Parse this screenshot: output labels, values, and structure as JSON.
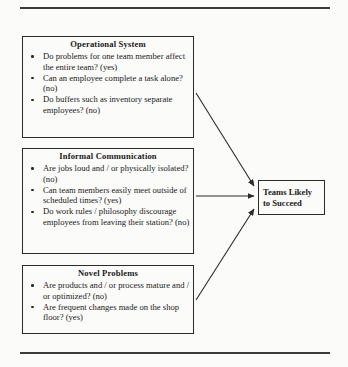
{
  "page": {
    "background_color": "#fbfbf9",
    "ink_color": "#2b2b2b",
    "top_rule": "horizontal-rule",
    "bottom_rule": "horizontal-rule"
  },
  "diagram": {
    "type": "flowchart",
    "layout": "three source boxes on the left converging with arrows into one outcome box on the right",
    "boxes": [
      {
        "id": "operational-system",
        "title": "Operational System",
        "bullets": [
          "Do problems for one team member affect the entire team? (yes)",
          "Can an employee complete a task alone? (no)",
          "Do buffers such as inventory separate employees? (no)"
        ]
      },
      {
        "id": "informal-communication",
        "title": "Informal Communication",
        "bullets": [
          "Are jobs loud and / or physically isolated? (no)",
          "Can team members easily meet outside of scheduled times? (yes)",
          "Do work rules / philosophy discourage employees from leaving their station? (no)"
        ]
      },
      {
        "id": "novel-problems",
        "title": "Novel Problems",
        "bullets": [
          "Are products and / or process mature and / or optimized? (no)",
          "Are frequent changes made on the shop floor? (yes)"
        ]
      }
    ],
    "outcome": {
      "id": "teams-likely-to-succeed",
      "line1": "Teams Likely",
      "line2": "to Succeed"
    },
    "connectors": [
      {
        "from": "operational-system",
        "to": "teams-likely-to-succeed",
        "style": "arrow"
      },
      {
        "from": "informal-communication",
        "to": "teams-likely-to-succeed",
        "style": "arrow"
      },
      {
        "from": "novel-problems",
        "to": "teams-likely-to-succeed",
        "style": "arrow"
      }
    ]
  }
}
